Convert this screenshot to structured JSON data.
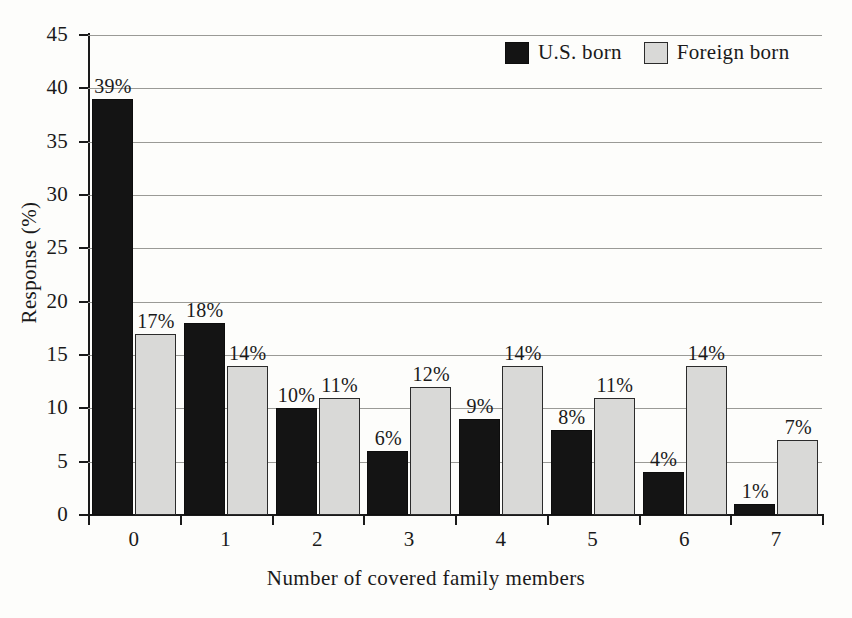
{
  "chart_data": {
    "type": "bar",
    "title": "",
    "subtitle": "",
    "xlabel": "Number of covered family members",
    "ylabel": "Response (%)",
    "categories": [
      "0",
      "1",
      "2",
      "3",
      "4",
      "5",
      "6",
      "7"
    ],
    "series": [
      {
        "name": "U.S. born",
        "color": "#141414",
        "values": [
          39,
          18,
          10,
          6,
          9,
          8,
          4,
          1
        ],
        "labels": [
          "39%",
          "18%",
          "10%",
          "6%",
          "9%",
          "8%",
          "4%",
          "1%"
        ]
      },
      {
        "name": "Foreign born",
        "color": "#d9d9d7",
        "values": [
          17,
          14,
          11,
          12,
          14,
          11,
          14,
          7
        ],
        "labels": [
          "17%",
          "14%",
          "11%",
          "12%",
          "14%",
          "11%",
          "14%",
          "7%"
        ]
      }
    ],
    "ylim": [
      0,
      45
    ],
    "ytick_values": [
      0,
      5,
      10,
      15,
      20,
      25,
      30,
      35,
      40,
      45
    ],
    "ytick_labels": [
      "0",
      "5",
      "10",
      "15",
      "20",
      "25",
      "30",
      "35",
      "40",
      "45"
    ],
    "grid": true,
    "grid_axis": "y",
    "legend_position": "top-right",
    "legend": [
      "U.S. born",
      "Foreign born"
    ]
  },
  "colors": {
    "background": "#fdfdfb",
    "axis": "#1a1a1a",
    "gridline": "#9a9a96",
    "series_us_born": "#141414",
    "series_foreign_born": "#d9d9d7"
  }
}
